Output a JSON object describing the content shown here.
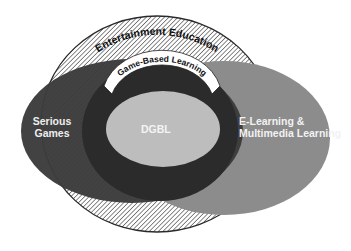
{
  "diagram": {
    "type": "nested-venn",
    "regions": [
      {
        "id": "entertainment-education",
        "label": "Entertainment Education",
        "style": "hatched",
        "color": "#ffffff"
      },
      {
        "id": "game-based-learning",
        "label": "Game-Based Learning",
        "style": "solid",
        "color": "#2b2b2b"
      },
      {
        "id": "serious-games",
        "label": "Serious\nGames",
        "line1": "Serious",
        "line2": "Games",
        "style": "solid",
        "color": "#3c3c3c"
      },
      {
        "id": "e-learning",
        "label": "E-Learning & Multimedia Learning",
        "line1": "E-Learning &",
        "line2": "Multimedia Learning",
        "style": "solid",
        "color": "#8c8c8c"
      },
      {
        "id": "dgbl",
        "label": "DGBL",
        "style": "solid",
        "color": "#bdbdbd"
      }
    ]
  },
  "labels": {
    "entertainment_education": "Entertainment Education",
    "game_based_learning": "Game-Based Learning",
    "serious_games_1": "Serious",
    "serious_games_2": "Games",
    "dgbl": "DGBL",
    "elearning_1": "E-Learning &",
    "elearning_2": "Multimedia Learning"
  }
}
